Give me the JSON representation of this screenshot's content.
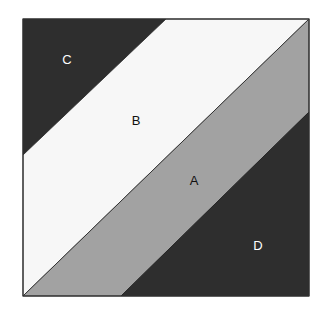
{
  "diagram": {
    "type": "square divided into diagonal bands",
    "square": {
      "x": 23,
      "y": 19,
      "width": 286,
      "height": 277
    },
    "regions": [
      {
        "id": "C",
        "label": "C",
        "fill": "#2e2e2e",
        "text_color": "#ffffff",
        "polygon": "23,19 166,19 23,155",
        "label_pos": {
          "x": 67,
          "y": 59
        }
      },
      {
        "id": "B",
        "label": "B",
        "fill": "#f7f7f7",
        "text_color": "#111111",
        "polygon": "166,19 309,19 23,296 23,155",
        "label_pos": {
          "x": 136,
          "y": 120
        }
      },
      {
        "id": "A",
        "label": "A",
        "fill": "#a2a2a2",
        "text_color": "#111111",
        "polygon": "309,19 309,112 121,296 23,296",
        "label_pos": {
          "x": 194,
          "y": 180
        }
      },
      {
        "id": "D",
        "label": "D",
        "fill": "#2e2e2e",
        "text_color": "#ffffff",
        "polygon": "309,112 309,296 121,296",
        "label_pos": {
          "x": 258,
          "y": 245
        }
      }
    ],
    "border_color": "#333333"
  }
}
